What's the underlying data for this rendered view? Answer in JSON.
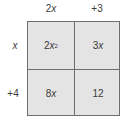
{
  "column_headers": [
    {
      "coef": "2",
      "var": "x"
    },
    {
      "text": "+3"
    }
  ],
  "row_headers": [
    {
      "var": "x"
    },
    {
      "text": "+4"
    }
  ],
  "cells": [
    {
      "coef": "2",
      "var": "x",
      "exp": "2"
    },
    {
      "coef": "3",
      "var": "x"
    },
    {
      "coef": "8",
      "var": "x"
    },
    {
      "text": "12"
    }
  ]
}
